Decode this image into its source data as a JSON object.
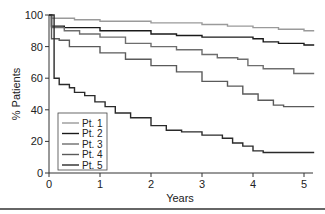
{
  "chart_data": {
    "type": "line",
    "subtype": "step (Kaplan-Meier)",
    "title": "",
    "xlabel": "Years",
    "ylabel": "% Patients",
    "xlim": [
      0,
      5.2
    ],
    "ylim": [
      0,
      100
    ],
    "x_ticks": [
      0,
      1,
      2,
      3,
      4,
      5
    ],
    "y_ticks": [
      0,
      20,
      40,
      60,
      80,
      100
    ],
    "grid": false,
    "legend_position": "lower left",
    "series": [
      {
        "name": "Pt. 1",
        "color": "#9a9a9a",
        "points": [
          [
            0,
            100
          ],
          [
            0.05,
            98
          ],
          [
            0.5,
            97
          ],
          [
            1,
            96
          ],
          [
            2,
            95
          ],
          [
            3,
            94
          ],
          [
            3.5,
            93
          ],
          [
            4,
            92
          ],
          [
            4.5,
            91
          ],
          [
            5,
            90
          ],
          [
            5.2,
            90
          ]
        ]
      },
      {
        "name": "Pt. 2",
        "color": "#1a1a1a",
        "points": [
          [
            0,
            100
          ],
          [
            0.05,
            93
          ],
          [
            0.3,
            92
          ],
          [
            1,
            90
          ],
          [
            2,
            88
          ],
          [
            2.5,
            87
          ],
          [
            3,
            86
          ],
          [
            3.5,
            86
          ],
          [
            4,
            85
          ],
          [
            4.2,
            83
          ],
          [
            4.5,
            82
          ],
          [
            5,
            81
          ],
          [
            5.2,
            81
          ]
        ]
      },
      {
        "name": "Pt. 3",
        "color": "#6e6e6e",
        "points": [
          [
            0,
            100
          ],
          [
            0.05,
            92
          ],
          [
            0.3,
            90
          ],
          [
            0.6,
            88
          ],
          [
            1,
            86
          ],
          [
            1.5,
            82
          ],
          [
            2,
            80
          ],
          [
            2.5,
            78
          ],
          [
            3,
            75
          ],
          [
            3.3,
            73
          ],
          [
            3.7,
            72
          ],
          [
            3.9,
            68
          ],
          [
            4.2,
            66
          ],
          [
            4.6,
            66
          ],
          [
            4.8,
            63
          ],
          [
            5.2,
            63
          ]
        ]
      },
      {
        "name": "Pt. 4",
        "color": "#5a5a5a",
        "points": [
          [
            0,
            100
          ],
          [
            0.05,
            85
          ],
          [
            0.2,
            84
          ],
          [
            0.4,
            80
          ],
          [
            1,
            76
          ],
          [
            1.5,
            72
          ],
          [
            2,
            68
          ],
          [
            2.5,
            64
          ],
          [
            3,
            58
          ],
          [
            3.5,
            55
          ],
          [
            3.8,
            50
          ],
          [
            4.1,
            46
          ],
          [
            4.4,
            43
          ],
          [
            4.6,
            42
          ],
          [
            5.2,
            42
          ]
        ]
      },
      {
        "name": "Pt. 5",
        "color": "#2a2a2a",
        "points": [
          [
            0,
            100
          ],
          [
            0.1,
            100
          ],
          [
            0.1,
            60
          ],
          [
            0.2,
            56
          ],
          [
            0.4,
            54
          ],
          [
            0.5,
            51
          ],
          [
            0.7,
            49
          ],
          [
            0.9,
            45
          ],
          [
            1.1,
            42
          ],
          [
            1.3,
            38
          ],
          [
            1.6,
            35
          ],
          [
            2,
            30
          ],
          [
            2.3,
            27
          ],
          [
            2.6,
            26
          ],
          [
            3,
            24
          ],
          [
            3.4,
            22
          ],
          [
            3.6,
            19
          ],
          [
            3.8,
            17
          ],
          [
            4,
            14
          ],
          [
            4.2,
            13
          ],
          [
            4.8,
            13
          ],
          [
            5.2,
            13
          ]
        ]
      }
    ]
  },
  "legend": {
    "items": [
      "Pt. 1",
      "Pt. 2",
      "Pt. 3",
      "Pt. 4",
      "Pt. 5"
    ]
  },
  "axes": {
    "x_title": "Years",
    "y_title": "% Patients"
  }
}
